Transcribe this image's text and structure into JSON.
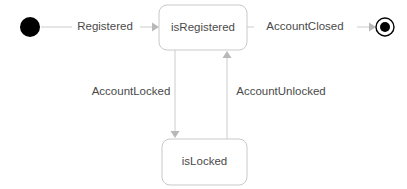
{
  "diagram": {
    "type": "uml-state-machine",
    "title": "",
    "canvas": {
      "width": 407,
      "height": 189,
      "background": "#ffffff"
    },
    "colors": {
      "text": "#4a4a4a",
      "state_border": "#c9c9c9",
      "state_fill": "#ffffff",
      "edge": "#cccccc",
      "arrow_head": "#b8b8b8",
      "pseudostate": "#000000"
    },
    "nodes": {
      "initial": {
        "kind": "initial-pseudostate",
        "label": "",
        "cx": 30,
        "cy": 27,
        "r": 10
      },
      "is_registered": {
        "kind": "state",
        "label": "isRegistered",
        "x": 159,
        "y": 5,
        "width": 88,
        "height": 45,
        "rx": 8
      },
      "is_locked": {
        "kind": "state",
        "label": "isLocked",
        "x": 162,
        "y": 139,
        "width": 85,
        "height": 46,
        "rx": 8
      },
      "final": {
        "kind": "final-state",
        "label": "",
        "cx": 385,
        "cy": 27,
        "r_outer": 9,
        "r_inner": 5
      }
    },
    "transitions": [
      {
        "id": "registered",
        "label": "Registered",
        "from": "initial",
        "to": "is_registered",
        "label_x": 105,
        "label_y": 27,
        "direction": "right"
      },
      {
        "id": "account-closed",
        "label": "AccountClosed",
        "from": "is_registered",
        "to": "final",
        "label_x": 305,
        "label_y": 27,
        "direction": "right"
      },
      {
        "id": "account-locked",
        "label": "AccountLocked",
        "from": "is_registered",
        "to": "is_locked",
        "label_x": 131,
        "label_y": 92,
        "direction": "down"
      },
      {
        "id": "account-unlocked",
        "label": "AccountUnlocked",
        "from": "is_locked",
        "to": "is_registered",
        "label_x": 281,
        "label_y": 92,
        "direction": "up"
      }
    ]
  }
}
